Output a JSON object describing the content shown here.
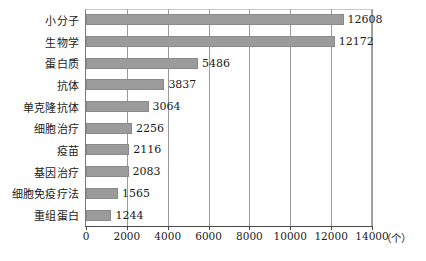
{
  "chart_data": {
    "type": "bar",
    "orientation": "horizontal",
    "title": "",
    "xlabel": "",
    "ylabel": "",
    "unit_label": "（个）",
    "xlim": [
      0,
      14000
    ],
    "xticks": [
      0,
      2000,
      4000,
      6000,
      8000,
      10000,
      12000,
      14000
    ],
    "xtick_labels": [
      "0",
      "2000",
      "4000",
      "6000",
      "8000",
      "10000",
      "12000",
      "14000"
    ],
    "grid": true,
    "legend": false,
    "bar_color": "#9b9b9b",
    "categories": [
      "小分子",
      "生物学",
      "蛋白质",
      "抗体",
      "单克隆抗体",
      "细胞治疗",
      "疫苗",
      "基因治疗",
      "细胞免疫疗法",
      "重组蛋白"
    ],
    "values": [
      12608,
      12172,
      5486,
      3837,
      3064,
      2256,
      2116,
      2083,
      1565,
      1244
    ],
    "value_labels": [
      "12608",
      "12172",
      "5486",
      "3837",
      "3064",
      "2256",
      "2116",
      "2083",
      "1565",
      "1244"
    ]
  }
}
